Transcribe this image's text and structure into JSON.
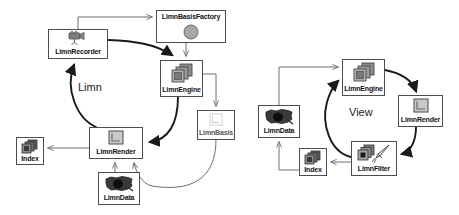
{
  "diagram": {
    "groups": [
      {
        "id": "limn",
        "label": "Limn",
        "x": 78,
        "y": 81
      },
      {
        "id": "view",
        "label": "View",
        "x": 349,
        "y": 106
      }
    ],
    "nodes": [
      {
        "id": "limnbasisfactory",
        "label": "LimnBasisFactory",
        "icon": "gray-circle-icon",
        "x": 156,
        "y": 10,
        "w": 70,
        "h": 33,
        "labelPos": "top"
      },
      {
        "id": "limnrecorder",
        "label": "LimnRecorder",
        "icon": "video-camera-icon",
        "x": 48,
        "y": 29,
        "w": 60,
        "h": 30,
        "labelPos": "bottom"
      },
      {
        "id": "limnengine",
        "label": "LimnEngine",
        "icon": "stacked-squares-icon",
        "x": 160,
        "y": 60,
        "w": 43,
        "h": 37,
        "labelPos": "bottom"
      },
      {
        "id": "limnbasis",
        "label": "LimnBasis",
        "icon": "light-frame-icon",
        "x": 197,
        "y": 110,
        "w": 38,
        "h": 30,
        "labelPos": "bottom"
      },
      {
        "id": "limnrender",
        "label": "LimnRender",
        "icon": "frame-square-icon",
        "x": 89,
        "y": 127,
        "w": 54,
        "h": 32,
        "labelPos": "bottom"
      },
      {
        "id": "limndata",
        "label": "LimnData",
        "icon": "us-map-icon",
        "x": 98,
        "y": 172,
        "w": 42,
        "h": 33,
        "labelPos": "bottom"
      },
      {
        "id": "index-left",
        "label": "Index",
        "icon": "stacked-dark-icon",
        "x": 16,
        "y": 137,
        "w": 28,
        "h": 28,
        "labelPos": "bottom"
      },
      {
        "id": "view-limnengine",
        "label": "LimnEngine",
        "icon": "stacked-squares-icon",
        "x": 342,
        "y": 59,
        "w": 43,
        "h": 37,
        "labelPos": "bottom"
      },
      {
        "id": "view-limnrender",
        "label": "LimnRender",
        "icon": "frame-square-icon",
        "x": 398,
        "y": 95,
        "w": 45,
        "h": 32,
        "labelPos": "bottom"
      },
      {
        "id": "view-limnfilter",
        "label": "LimnFilter",
        "icon": "filter-brush-icon",
        "x": 351,
        "y": 141,
        "w": 46,
        "h": 35,
        "labelPos": "bottom"
      },
      {
        "id": "view-limndata",
        "label": "LimnData",
        "icon": "us-map-icon",
        "x": 258,
        "y": 105,
        "w": 42,
        "h": 33,
        "labelPos": "bottom"
      },
      {
        "id": "view-index",
        "label": "Index",
        "icon": "stacked-dark-icon",
        "x": 299,
        "y": 148,
        "w": 28,
        "h": 28,
        "labelPos": "bottom"
      }
    ],
    "colors": {
      "box_border": "#4d4d4d",
      "edge_thin": "#6e6e6e",
      "edge_thick": "#1a1a1a",
      "icon_gray": "#9a9a9a",
      "icon_dark": "#3d3d3d",
      "background": "#ffffff",
      "text": "#111111"
    }
  }
}
